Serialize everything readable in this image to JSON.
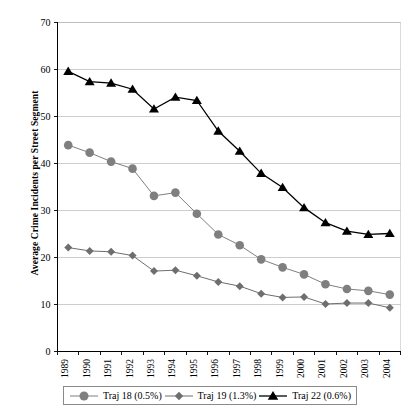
{
  "chart_data": {
    "type": "line",
    "title": "",
    "xlabel": "",
    "ylabel": "Average Crime Incidents per Street Segment",
    "categories": [
      "1989",
      "1990",
      "1991",
      "1992",
      "1993",
      "1994",
      "1995",
      "1996",
      "1997",
      "1998",
      "1999",
      "2000",
      "2001",
      "2002",
      "2003",
      "2004"
    ],
    "ylim": [
      0,
      70
    ],
    "yticks": [
      0,
      10,
      20,
      30,
      40,
      50,
      60,
      70
    ],
    "grid": true,
    "legend_position": "bottom",
    "series": [
      {
        "name": "Traj 18 (0.5%)",
        "marker": "circle",
        "color": "#7f7f7f",
        "values": [
          43.8,
          42.2,
          40.3,
          38.8,
          33.0,
          33.7,
          29.2,
          24.8,
          22.5,
          19.5,
          17.8,
          16.3,
          14.2,
          13.2,
          12.8,
          12.0
        ]
      },
      {
        "name": "Traj 19 (1.3%)",
        "marker": "diamond",
        "color": "#6e6e6e",
        "values": [
          22.0,
          21.3,
          21.1,
          20.3,
          17.0,
          17.2,
          16.0,
          14.7,
          13.8,
          12.2,
          11.4,
          11.5,
          10.0,
          10.2,
          10.2,
          9.2
        ]
      },
      {
        "name": "Traj 22 (0.6%)",
        "marker": "triangle",
        "color": "#000000",
        "values": [
          59.5,
          57.3,
          57.0,
          55.7,
          51.5,
          54.0,
          53.3,
          46.8,
          42.5,
          37.8,
          34.8,
          30.5,
          27.3,
          25.5,
          24.8,
          25.0
        ]
      }
    ]
  },
  "axes": {
    "y_title": "Average Crime Incidents per Street Segment"
  },
  "legend": {
    "entries": [
      {
        "label": "Traj 18 (0.5%)"
      },
      {
        "label": "Traj 19 (1.3%)"
      },
      {
        "label": "Traj 22 (0.6%)"
      }
    ]
  }
}
